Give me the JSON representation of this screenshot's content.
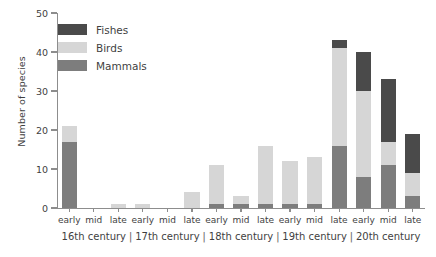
{
  "chart_data": {
    "type": "bar",
    "stacked": true,
    "title": "",
    "xlabel": "",
    "ylabel": "Number of species",
    "ylim": [
      0,
      50
    ],
    "yticks": [
      0,
      10,
      20,
      30,
      40,
      50
    ],
    "ytick_labels": [
      "0",
      "10",
      "20",
      "30",
      "40",
      "50"
    ],
    "grid": false,
    "legend_position": "upper-left-inside",
    "categories": [
      "early",
      "mid",
      "late",
      "early",
      "mid",
      "late",
      "early",
      "mid",
      "late",
      "early",
      "mid",
      "late",
      "early",
      "mid",
      "late"
    ],
    "groups": [
      {
        "label": "16th century",
        "span": 3
      },
      {
        "label": "17th century",
        "span": 3
      },
      {
        "label": "18th century",
        "span": 3
      },
      {
        "label": "19th century",
        "span": 3
      },
      {
        "label": "20th century",
        "span": 3
      }
    ],
    "group_separator": "|",
    "series": [
      {
        "name": "Mammals",
        "color": "#7d7d7d",
        "values": [
          17,
          0,
          0,
          0,
          0,
          0,
          1,
          1,
          1,
          1,
          1,
          16,
          8,
          11,
          3
        ]
      },
      {
        "name": "Birds",
        "color": "#d6d6d6",
        "values": [
          4,
          0,
          1,
          1,
          0,
          4,
          10,
          2,
          15,
          11,
          12,
          25,
          22,
          6,
          6
        ]
      },
      {
        "name": "Fishes",
        "color": "#4a4a4a",
        "values": [
          0,
          0,
          0,
          0,
          0,
          0,
          0,
          0,
          0,
          0,
          0,
          2,
          10,
          16,
          10
        ]
      }
    ],
    "totals": [
      21,
      0,
      1,
      1,
      0,
      4,
      11,
      3,
      16,
      12,
      13,
      43,
      40,
      33,
      19
    ],
    "legend": [
      {
        "label": "Fishes",
        "color": "#4a4a4a"
      },
      {
        "label": "Birds",
        "color": "#d6d6d6"
      },
      {
        "label": "Mammals",
        "color": "#7d7d7d"
      }
    ]
  }
}
